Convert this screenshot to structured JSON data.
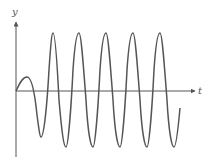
{
  "figure": {
    "axes": {
      "x_label": "t",
      "y_label": "y"
    },
    "colors": {
      "curve": "#555555",
      "axes": "#555555",
      "background": "#ffffff"
    },
    "curve": {
      "start": [
        0,
        0
      ],
      "initial_bump_peak_relative": 0.25,
      "steady_amplitude_relative": 1.0,
      "num_full_peaks": 5,
      "num_full_troughs": 6
    }
  }
}
